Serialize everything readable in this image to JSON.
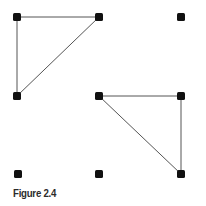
{
  "figure": {
    "caption": "Figure 2.4",
    "dot_color": "#111111",
    "line_color": "#555555",
    "dots": [
      {
        "id": "r0c0",
        "x": 17,
        "y": 17
      },
      {
        "id": "r0c1",
        "x": 99,
        "y": 17
      },
      {
        "id": "r0c2",
        "x": 181,
        "y": 17
      },
      {
        "id": "r1c0",
        "x": 17,
        "y": 96
      },
      {
        "id": "r1c1",
        "x": 99,
        "y": 96
      },
      {
        "id": "r1c2",
        "x": 181,
        "y": 96
      },
      {
        "id": "r2c0",
        "x": 18,
        "y": 174
      },
      {
        "id": "r2c1",
        "x": 99,
        "y": 174
      },
      {
        "id": "r2c2",
        "x": 181,
        "y": 174
      }
    ],
    "triangles": [
      {
        "name": "upper-left-triangle",
        "vertices": [
          "r0c0",
          "r0c1",
          "r1c0"
        ]
      },
      {
        "name": "lower-right-triangle",
        "vertices": [
          "r1c1",
          "r1c2",
          "r2c2"
        ]
      }
    ]
  }
}
